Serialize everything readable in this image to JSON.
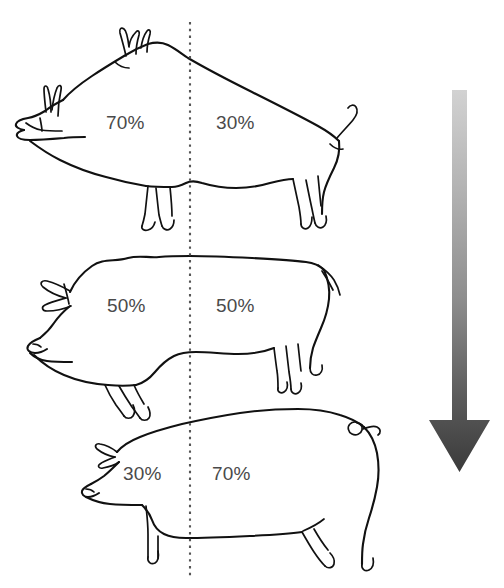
{
  "figure": {
    "width": 504,
    "height": 588,
    "background_color": "#ffffff",
    "divider": {
      "x": 190,
      "y_top": 22,
      "y_bottom": 578,
      "style": "dotted",
      "color": "#555555"
    },
    "trend_arrow": {
      "direction": "down",
      "gradient_from": "#cfcfcf",
      "gradient_to": "#3a3a3a",
      "x_center": 459,
      "y_top": 90,
      "y_bottom": 472
    }
  },
  "label_color": "#4a4a4a",
  "animals": [
    {
      "name": "wild-boar",
      "front_percent": "70%",
      "rear_percent": "30%",
      "front_label_x": 106,
      "front_label_y": 113,
      "rear_label_x": 216,
      "rear_label_y": 113
    },
    {
      "name": "traditional-pig",
      "front_percent": "50%",
      "rear_percent": "50%",
      "front_label_x": 107,
      "front_label_y": 296,
      "rear_label_x": 216,
      "rear_label_y": 296
    },
    {
      "name": "modern-pig",
      "front_percent": "30%",
      "rear_percent": "70%",
      "front_label_x": 123,
      "front_label_y": 464,
      "rear_label_x": 212,
      "rear_label_y": 464
    }
  ]
}
